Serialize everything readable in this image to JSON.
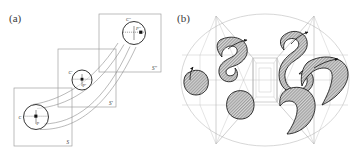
{
  "figure": {
    "panels": [
      {
        "tag": "(a)",
        "name": "panel-a-sweep-diagram",
        "description": "Three overlapping square frames in a staircase arrangement, each containing a circle with a marked interior point, connected by curved flow lines.",
        "frames": [
          {
            "label": "S",
            "x": 14,
            "y": 88,
            "size": 58
          },
          {
            "label": "S'",
            "x": 58,
            "y": 49,
            "size": 58
          },
          {
            "label": "S''",
            "x": 99,
            "y": 14,
            "size": 58
          }
        ],
        "circles": [
          {
            "center_label": "C",
            "point_label": "P",
            "cx": 36,
            "cy": 117,
            "r": 12.5
          },
          {
            "center_label": "C'",
            "point_label": "P'",
            "cx": 82,
            "cy": 80,
            "r": 10.0
          },
          {
            "center_label": "C''",
            "point_label": "P''",
            "cx": 134,
            "cy": 33,
            "r": 11.5
          }
        ]
      },
      {
        "tag": "(b)",
        "name": "panel-b-deformed-regions",
        "description": "Hatched hook-shaped regions and a round blob inside a large ellipse overlaid on a polygonal wireframe mesh.",
        "ellipse": {
          "cx": 265,
          "cy": 80,
          "rx": 84,
          "ry": 66
        },
        "blob_fill": "#c8c8c8",
        "blob_stroke": "#141414",
        "blobs": [
          {
            "name": "round-blob-left",
            "arrow": true
          },
          {
            "name": "hook-blob-upper-left",
            "arrow": true
          },
          {
            "name": "round-blob-lower-left",
            "arrow": false
          },
          {
            "name": "hook-blob-center",
            "arrow": true
          },
          {
            "name": "hook-blob-right",
            "arrow": true
          },
          {
            "name": "hook-blob-lower-center",
            "arrow": false
          }
        ]
      }
    ],
    "colors": {
      "frame_stroke": "#9a9a9a",
      "flow_stroke": "#808080",
      "ellipse_stroke": "#c9c9c9",
      "wire_stroke": "#a9a9a9",
      "ink": "#141414",
      "hatch": "#c8c8c8"
    }
  }
}
